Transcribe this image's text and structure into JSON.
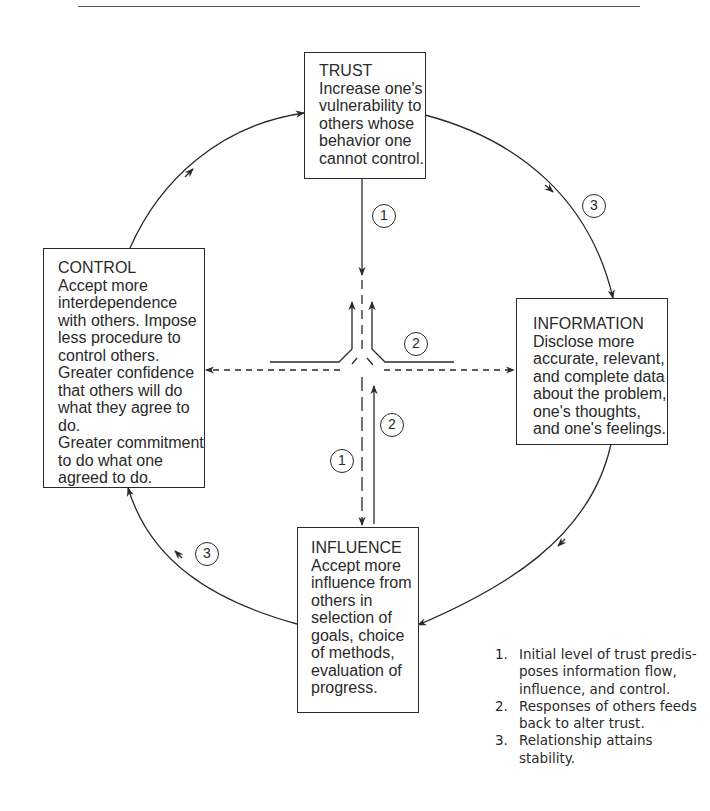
{
  "diagram": {
    "type": "cycle-diagram",
    "boxes": {
      "trust": {
        "title": "TRUST",
        "body": "Increase one's\nvulnerability to\nothers whose\nbehavior one\ncannot control."
      },
      "control": {
        "title": "CONTROL",
        "body": "Accept more\ninterdependence\nwith others. Impose\nless procedure to\ncontrol others.\nGreater confidence\nthat others will do\nwhat they agree to do.\nGreater commitment\nto do what one\nagreed to do."
      },
      "information": {
        "title": "INFORMATION",
        "body": "Disclose more\naccurate, relevant,\nand complete data\nabout the problem,\none's thoughts,\nand one's feelings."
      },
      "influence": {
        "title": "INFLUENCE",
        "body": "Accept more\ninfluence from\nothers in\nselection of\ngoals, choice\nof methods,\nevaluation of\nprogress."
      }
    },
    "badges": {
      "trust_down_1": "1",
      "center_right_2": "2",
      "upper_right_3": "3",
      "influence_up_2": "2",
      "influence_down_1": "1",
      "lower_left_3": "3"
    },
    "edges": [
      {
        "from": "trust",
        "to": "center",
        "style": "solid",
        "label": "1"
      },
      {
        "from": "center",
        "to": "control",
        "style": "dashed",
        "label": "1"
      },
      {
        "from": "center",
        "to": "information",
        "style": "dashed",
        "label": "1"
      },
      {
        "from": "center",
        "to": "influence",
        "style": "dashed",
        "label": "1"
      },
      {
        "from": "control",
        "to": "trust",
        "style": "solid",
        "label": "2"
      },
      {
        "from": "information",
        "to": "trust",
        "style": "solid",
        "label": "2"
      },
      {
        "from": "influence",
        "to": "trust",
        "style": "solid",
        "label": "2"
      },
      {
        "from": "trust",
        "to": "information",
        "style": "curved",
        "label": "3"
      },
      {
        "from": "information",
        "to": "influence",
        "style": "curved",
        "label": "3"
      },
      {
        "from": "influence",
        "to": "control",
        "style": "curved",
        "label": "3"
      },
      {
        "from": "control",
        "to": "trust",
        "style": "curved",
        "label": "3"
      }
    ],
    "colors": {
      "ink": "#2a2a2a",
      "background": "#ffffff"
    }
  },
  "notes": [
    {
      "num": "1.",
      "text": "Initial level of trust predis-\nposes information flow,\ninfluence, and control."
    },
    {
      "num": "2.",
      "text": "Responses of others feeds\nback to alter trust."
    },
    {
      "num": "3.",
      "text": "Relationship attains stability."
    }
  ]
}
